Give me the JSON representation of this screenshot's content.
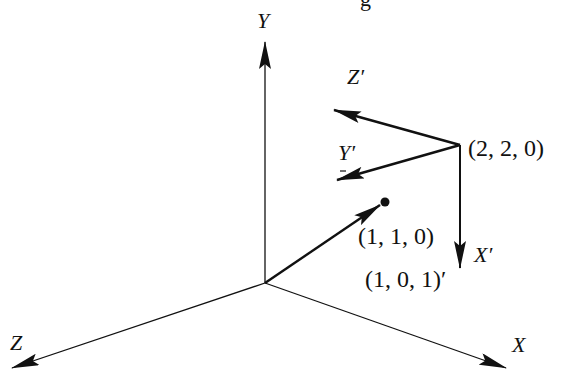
{
  "diagram": {
    "type": "3d-coordinate-frames",
    "colors": {
      "ink": "#111111",
      "background": "#ffffff"
    },
    "world_axes": {
      "x_label": "X",
      "y_label": "Y",
      "z_label": "Z"
    },
    "local_axes": {
      "origin_label": "(2, 2, 0)",
      "x_label": "X′",
      "y_label": "Y′",
      "z_label": "Z′"
    },
    "points": {
      "target_point_label": "(1, 1, 0)",
      "local_coord_label": "(1, 0, 1)′"
    },
    "top_partial_glyph": "g"
  }
}
